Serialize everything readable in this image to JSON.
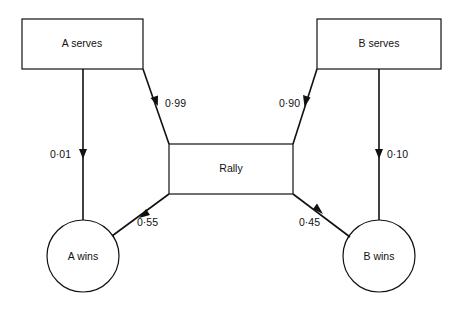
{
  "diagram": {
    "type": "state-transition",
    "nodes": [
      {
        "id": "a_serves",
        "label": "A serves",
        "shape": "rect"
      },
      {
        "id": "b_serves",
        "label": "B serves",
        "shape": "rect"
      },
      {
        "id": "rally",
        "label": "Rally",
        "shape": "rect"
      },
      {
        "id": "a_wins",
        "label": "A wins",
        "shape": "circle"
      },
      {
        "id": "b_wins",
        "label": "B wins",
        "shape": "circle"
      }
    ],
    "edges": [
      {
        "from": "a_serves",
        "to": "rally",
        "label": "0·99"
      },
      {
        "from": "a_serves",
        "to": "a_wins",
        "label": "0·01"
      },
      {
        "from": "b_serves",
        "to": "rally",
        "label": "0·90"
      },
      {
        "from": "b_serves",
        "to": "b_wins",
        "label": "0·10"
      },
      {
        "from": "rally",
        "to": "a_wins",
        "label": "0·55"
      },
      {
        "from": "rally",
        "to": "b_wins",
        "label": "0·45"
      }
    ]
  },
  "labels": {
    "a_serves": "A serves",
    "b_serves": "B serves",
    "rally": "Rally",
    "a_wins": "A wins",
    "b_wins": "B wins",
    "p_a_rally": "0·99",
    "p_a_win": "0·01",
    "p_b_rally": "0·90",
    "p_b_win": "0·10",
    "p_rally_a": "0·55",
    "p_rally_b": "0·45"
  },
  "colors": {
    "stroke": "#111111",
    "background": "#ffffff"
  }
}
